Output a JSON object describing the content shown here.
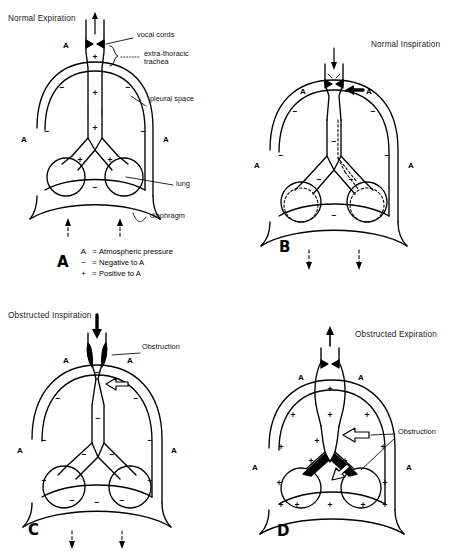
{
  "figure": {
    "ink_color": "#000000",
    "background_color": "#ffffff"
  },
  "legend": {
    "rows": [
      {
        "symbol": "A",
        "equals": "=",
        "text": "Atmospheric pressure"
      },
      {
        "symbol": "−",
        "equals": "=",
        "text": "Negative to A"
      },
      {
        "symbol": "+",
        "equals": "=",
        "text": "Positive to A"
      }
    ]
  },
  "panels": [
    {
      "letter": "A",
      "title": "Normal Expiration",
      "airflow_direction": "up",
      "airway_sign": "+",
      "pleural_sign": "−",
      "diaphragm_arrows": "up",
      "atmospheric_labels": [
        "A",
        "A",
        "A"
      ],
      "callouts": [
        {
          "name": "vocal-cords",
          "text": "vocal cords"
        },
        {
          "name": "extra-thoracic-trachea",
          "text": "extra-thoracic"
        },
        {
          "name": "extra-thoracic-trachea-line2",
          "text": "trachea"
        },
        {
          "name": "pleural-space",
          "text": "pleural space"
        },
        {
          "name": "lung",
          "text": "lung"
        },
        {
          "name": "diaphragm",
          "text": "diaphragm"
        }
      ]
    },
    {
      "letter": "B",
      "title": "Normal Inspiration",
      "airflow_direction": "down",
      "airway_sign": "−",
      "pleural_sign": "−",
      "diaphragm_arrows": "down",
      "atmospheric_labels": [
        "A",
        "A",
        "A",
        "A"
      ],
      "callouts": []
    },
    {
      "letter": "C",
      "title": "Obstructed Inspiration",
      "airflow_direction": "down",
      "airway_sign": "−",
      "pleural_sign": "−",
      "diaphragm_arrows": "down",
      "atmospheric_labels": [
        "A",
        "A",
        "A",
        "A"
      ],
      "callouts": [
        {
          "name": "obstruction",
          "text": "Obstruction"
        }
      ]
    },
    {
      "letter": "D",
      "title": "Obstructed Expiration",
      "airflow_direction": "up",
      "airway_sign": "+",
      "pleural_sign": "+",
      "diaphragm_arrows": "up",
      "atmospheric_labels": [
        "A",
        "A",
        "A",
        "A"
      ],
      "callouts": [
        {
          "name": "obstruction",
          "text": "Obstruction"
        }
      ]
    }
  ],
  "symbols": {
    "minus": "−",
    "plus": "+",
    "atmos": "A"
  }
}
